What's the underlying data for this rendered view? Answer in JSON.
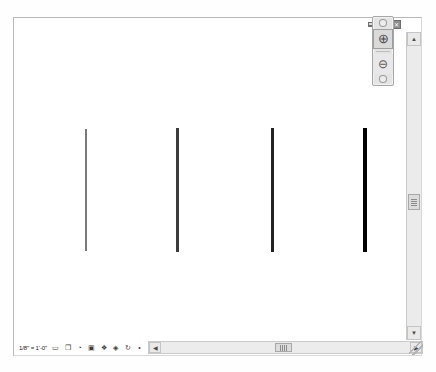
{
  "window": {
    "controls": [
      {
        "name": "minimize",
        "glyph": "–"
      },
      {
        "name": "restore",
        "glyph": "❐"
      },
      {
        "name": "close",
        "glyph": "✕"
      }
    ]
  },
  "drawing": {
    "description": "Four vertical lines of increasing line weight",
    "lines": [
      {
        "label": "line-weight-1",
        "x": 84,
        "top": 114,
        "bottom": 236,
        "width": 2.0,
        "color": "#7a7a7a"
      },
      {
        "label": "line-weight-2",
        "x": 176,
        "top": 113,
        "bottom": 237,
        "width": 2.5,
        "color": "#3c3c3c"
      },
      {
        "label": "line-weight-3",
        "x": 271,
        "top": 113,
        "bottom": 237,
        "width": 3.0,
        "color": "#222222"
      },
      {
        "label": "line-weight-4",
        "x": 363,
        "top": 113,
        "bottom": 237,
        "width": 3.5,
        "color": "#000000"
      }
    ]
  },
  "zoom_palette": {
    "tools": [
      {
        "name": "zoom-in-tool",
        "glyph": "⊕",
        "selected": true
      },
      {
        "name": "zoom-out-tool",
        "glyph": "⊖",
        "selected": false
      }
    ]
  },
  "scrollbars": {
    "vertical": {
      "up_glyph": "▲",
      "down_glyph": "▼",
      "thumb_position_px": 162
    },
    "horizontal": {
      "left_glyph": "◀",
      "right_glyph": "▶",
      "thumb_position_px": 126
    }
  },
  "status_bar": {
    "scale": "1/8\" = 1'-0\"",
    "tools": [
      {
        "name": "page-icon",
        "glyph": "▭"
      },
      {
        "name": "layers-icon",
        "glyph": "❐"
      },
      {
        "name": "classes-icon",
        "glyph": "◔"
      },
      {
        "name": "view-icon",
        "glyph": "▣"
      },
      {
        "name": "render-icon",
        "glyph": "❖"
      },
      {
        "name": "snap-icon",
        "glyph": "◈"
      },
      {
        "name": "rotate-view-icon",
        "glyph": "↻"
      },
      {
        "name": "constraints-icon",
        "glyph": "•"
      }
    ]
  }
}
